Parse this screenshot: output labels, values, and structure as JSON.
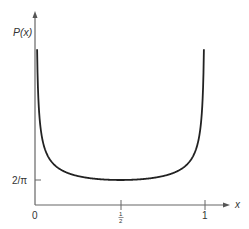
{
  "chart_data": {
    "type": "line",
    "title": "",
    "xlabel": "x",
    "ylabel": "P(x)",
    "function": "P(x) = 1/(pi*sqrt(x(1-x)))",
    "x_ticks": [
      {
        "value": 0,
        "label": "0"
      },
      {
        "value": 0.5,
        "label": "1/2"
      },
      {
        "value": 1,
        "label": "1"
      }
    ],
    "y_ticks": [
      {
        "value": 0.6366,
        "label": "2/π"
      }
    ],
    "xlim": [
      0,
      1
    ],
    "ylim": [
      0,
      4.9
    ],
    "grid": false,
    "legend": null,
    "series": [
      {
        "name": "P(x)",
        "x": [
          0.015,
          0.03,
          0.05,
          0.08,
          0.12,
          0.16,
          0.2,
          0.25,
          0.3,
          0.35,
          0.4,
          0.45,
          0.5,
          0.55,
          0.6,
          0.65,
          0.7,
          0.75,
          0.8,
          0.84,
          0.88,
          0.92,
          0.95,
          0.97,
          0.985
        ],
        "values": [
          2.62,
          1.87,
          1.46,
          1.17,
          0.98,
          0.87,
          0.8,
          0.74,
          0.69,
          0.67,
          0.65,
          0.64,
          0.64,
          0.64,
          0.65,
          0.67,
          0.69,
          0.74,
          0.8,
          0.87,
          0.98,
          1.17,
          1.46,
          1.87,
          2.62
        ]
      }
    ],
    "annotations": {
      "origin_label": "0",
      "min_point": {
        "x": 0.5,
        "y": 0.6366,
        "label": "2/π"
      }
    }
  },
  "labels": {
    "y_axis": "P(x)",
    "x_axis": "x",
    "origin": "0",
    "tick_half_num": "1",
    "tick_half_den": "2",
    "tick_one": "1",
    "y_tick": "2/π"
  },
  "colors": {
    "curve": "#222222",
    "axis": "#555555",
    "text": "#333333"
  }
}
